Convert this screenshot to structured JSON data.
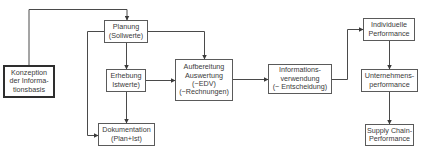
{
  "diagram": {
    "type": "flowchart",
    "colors": {
      "line": "#4a4a4a",
      "border": "#5a5a5a",
      "text": "#3a3a3a",
      "background": "#ffffff"
    },
    "nodes": [
      {
        "id": "konzeption",
        "lines": [
          "Konzeption",
          "der Informa-",
          "tionsbasis"
        ],
        "emphasis": "thick-border"
      },
      {
        "id": "planung",
        "lines": [
          "Planung",
          "(Sollwerte)"
        ]
      },
      {
        "id": "erhebung",
        "lines": [
          "Erhebung",
          "Istwerte)"
        ]
      },
      {
        "id": "dokumentation",
        "lines": [
          "Dokumentation",
          "(Plan+Ist)"
        ]
      },
      {
        "id": "aufbereitung",
        "lines": [
          "Aufbereitung",
          "Auswertung",
          "(~EDV)",
          "(~Rechnungen)"
        ]
      },
      {
        "id": "informationsverwendung",
        "lines": [
          "Informations-",
          "verwendung",
          "(~ Entscheidung)"
        ]
      },
      {
        "id": "individuelle",
        "lines": [
          "Individuelle",
          "Performance"
        ]
      },
      {
        "id": "unternehmens",
        "lines": [
          "Unternehmens-",
          "performance"
        ]
      },
      {
        "id": "supplychain",
        "lines": [
          "Supply Chain-",
          "Performance"
        ]
      }
    ],
    "edges": [
      {
        "from": "konzeption",
        "to": "planung"
      },
      {
        "from": "planung",
        "to": "erhebung"
      },
      {
        "from": "planung",
        "to": "aufbereitung"
      },
      {
        "from": "planung",
        "to": "dokumentation"
      },
      {
        "from": "erhebung",
        "to": "dokumentation"
      },
      {
        "from": "erhebung",
        "to": "aufbereitung"
      },
      {
        "from": "aufbereitung",
        "to": "informationsverwendung"
      },
      {
        "from": "informationsverwendung",
        "to": "individuelle"
      },
      {
        "from": "individuelle",
        "to": "unternehmens"
      },
      {
        "from": "unternehmens",
        "to": "supplychain"
      }
    ]
  }
}
